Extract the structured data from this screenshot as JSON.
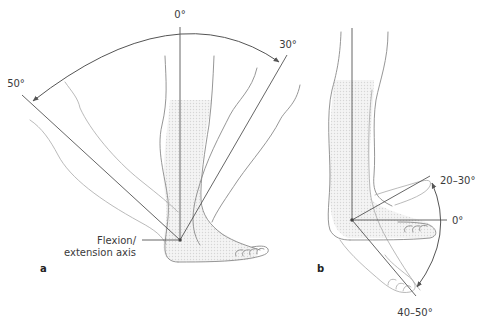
{
  "figure": {
    "panel_a": {
      "letter": "a",
      "labels": {
        "zero": "0°",
        "dorsiflexion": "30°",
        "plantarflexion": "50°",
        "axis_line1": "Flexion/",
        "axis_line2": "extension axis"
      }
    },
    "panel_b": {
      "letter": "b",
      "labels": {
        "zero": "0°",
        "upper": "20–30°",
        "lower": "40–50°"
      }
    },
    "colors": {
      "line": "#555555",
      "outline": "#8a8a8a",
      "shade": "#d8d8d8",
      "text": "#3a3a3a",
      "background": "#ffffff"
    }
  }
}
